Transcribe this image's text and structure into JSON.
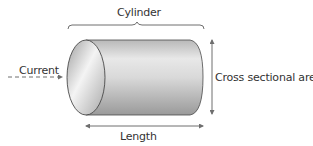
{
  "diagram": {
    "title_label": "Cylinder",
    "current_label": "Current",
    "cross_section_label": "Cross sectional area",
    "length_label": "Length"
  },
  "colors": {
    "outline": "#4a4a4a",
    "arrow": "#6e6e6e",
    "body_light": "#f2f2f2",
    "body_dark": "#9a9a9a",
    "text": "#333333"
  }
}
